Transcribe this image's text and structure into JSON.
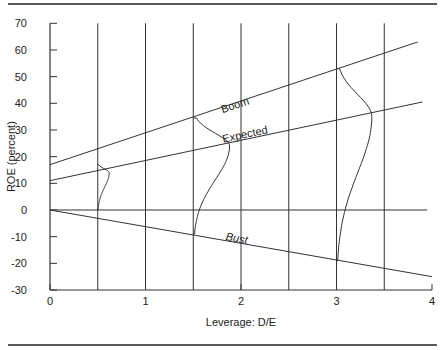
{
  "chart_data": {
    "type": "line",
    "title": "",
    "xlabel": "Leverage: D/E",
    "ylabel": "ROE (percent)",
    "xlim": [
      0,
      4
    ],
    "ylim": [
      -30,
      70
    ],
    "x_ticks": [
      0,
      1,
      2,
      3,
      4
    ],
    "x_tick_labels": [
      "0",
      "1",
      "2",
      "3",
      "4"
    ],
    "y_ticks": [
      -30,
      -20,
      -10,
      0,
      10,
      20,
      30,
      40,
      50,
      60,
      70
    ],
    "y_tick_labels": [
      "-30",
      "-20",
      "-10",
      "0",
      "10",
      "20",
      "30",
      "40",
      "50",
      "60",
      "70"
    ],
    "vertical_gridlines": [
      0.5,
      1,
      1.5,
      2,
      2.5,
      3,
      3.5
    ],
    "zero_line": {
      "x": [
        0,
        3.95
      ],
      "y": 0
    },
    "series": [
      {
        "name": "Boom",
        "label": "Boom",
        "x": [
          0,
          3.85
        ],
        "y": [
          17,
          63
        ],
        "label_at": [
          1.95,
          38
        ]
      },
      {
        "name": "Expected",
        "label": "Expected",
        "x": [
          0,
          3.9
        ],
        "y": [
          11,
          40.5
        ],
        "label_at": [
          2.05,
          27
        ]
      },
      {
        "name": "Bust",
        "label": "Bust",
        "x": [
          0,
          4
        ],
        "y": [
          0,
          -25
        ],
        "label_at": [
          1.95,
          -12
        ]
      }
    ],
    "distributions": [
      {
        "x_base": 0.5,
        "top": 17,
        "bottom": 0,
        "mean": 14,
        "peak_offset": 0.12
      },
      {
        "x_base": 1.5,
        "top": 34.5,
        "bottom": -9,
        "mean": 24,
        "peak_offset": 0.38
      },
      {
        "x_base": 3.0,
        "top": 53,
        "bottom": -19,
        "mean": 35,
        "peak_offset": 0.37
      }
    ],
    "grid": false,
    "legend": "none"
  }
}
